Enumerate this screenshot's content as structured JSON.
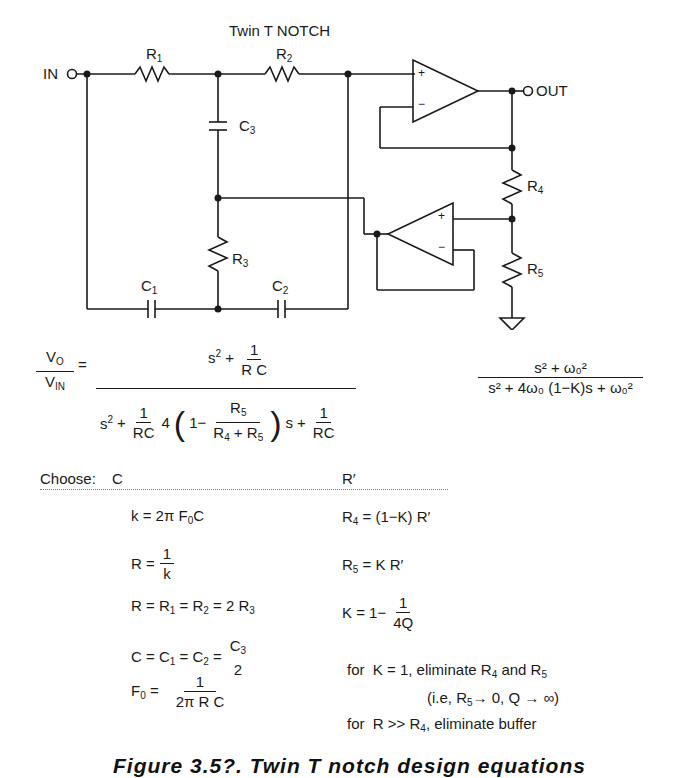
{
  "title": "Twin T NOTCH",
  "schematic": {
    "terminals": {
      "input": "IN",
      "output": "OUT"
    },
    "components": {
      "R1": {
        "label": "R",
        "sub": "1"
      },
      "R2": {
        "label": "R",
        "sub": "2"
      },
      "R3": {
        "label": "R",
        "sub": "3"
      },
      "R4": {
        "label": "R",
        "sub": "4"
      },
      "R5": {
        "label": "R",
        "sub": "5"
      },
      "C1": {
        "label": "C",
        "sub": "1"
      },
      "C2": {
        "label": "C",
        "sub": "2"
      },
      "C3": {
        "label": "C",
        "sub": "3"
      }
    },
    "opamp_pins": {
      "plus": "+",
      "minus": "−"
    }
  },
  "transfer_function": {
    "lhs_num": "V",
    "lhs_num_sub": "O",
    "lhs_den": "V",
    "lhs_den_sub": "IN",
    "equals": "=",
    "num_s": "s",
    "num_exp": "2",
    "plus": "+",
    "one": "1",
    "rc": "R C",
    "den_four": "4",
    "den_one_minus": "1−",
    "r5_num": "R",
    "r5_sub": "5",
    "r4_den": "R",
    "r4_sub": "4",
    "r5b_sub": "5",
    "den_s": "s",
    "rc2": "RC"
  },
  "normalized_tf": {
    "numerator": "s² + ω₀²",
    "denominator": "s² + 4ω₀ (1−K)s + ω₀²"
  },
  "choose": {
    "label": "Choose:",
    "left": "C",
    "right": "R′"
  },
  "left_equations": [
    "k = 2πF₀C",
    "R = 1/k",
    "R = R₁ = R₂ = 2R₃",
    "C = C₁ = C₂ = C₃/2",
    "F₀ = 1/(2πRC)"
  ],
  "right_equations": [
    "R₄ = (1−K) R′",
    "R₅ = K R′",
    "K = 1− 1/(4Q)"
  ],
  "notes": [
    "for  K = 1, eliminate R₄ and R₅",
    "(i.e, R₅→ 0, Q → ∞)",
    "for  R >> R₄, eliminate buffer"
  ],
  "caption": "Figure 3.5?. Twin T notch design equations"
}
